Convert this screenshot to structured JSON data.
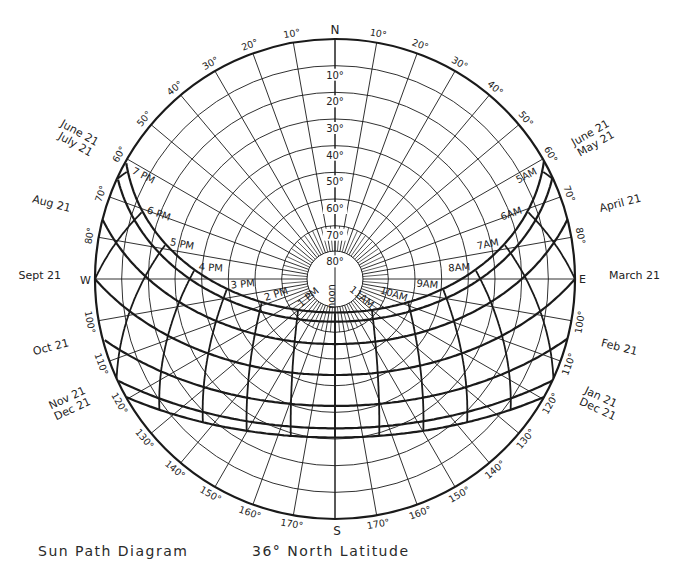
{
  "caption": {
    "title": "Sun Path Diagram",
    "latitude_label": "36° North Latitude"
  },
  "geometry": {
    "center": [
      335,
      279
    ],
    "radius": 240,
    "inner_circle_radius": 28,
    "latitude_deg": 36,
    "line_color": "#1a1a1a",
    "background": "#ffffff"
  },
  "cardinal": {
    "north": "N",
    "south": "S",
    "east": "E",
    "west": "W"
  },
  "altitude_circles": [
    10,
    20,
    30,
    40,
    50,
    60,
    70,
    80
  ],
  "altitude_labels": [
    "10°",
    "20°",
    "30°",
    "40°",
    "50°",
    "60°",
    "70°",
    "80°"
  ],
  "azimuth_spokes_step_deg": 10,
  "azimuth_labels": [
    {
      "azimuth": 10,
      "text": "170°"
    },
    {
      "azimuth": 20,
      "text": "160°"
    },
    {
      "azimuth": 30,
      "text": "150°"
    },
    {
      "azimuth": 40,
      "text": "140°"
    },
    {
      "azimuth": 50,
      "text": "130°"
    },
    {
      "azimuth": 60,
      "text": "120°"
    },
    {
      "azimuth": 70,
      "text": "110°"
    },
    {
      "azimuth": 80,
      "text": "100°"
    },
    {
      "azimuth": 100,
      "text": "80°"
    },
    {
      "azimuth": 110,
      "text": "70°"
    },
    {
      "azimuth": 120,
      "text": "60°"
    },
    {
      "azimuth": 130,
      "text": "50°"
    },
    {
      "azimuth": 140,
      "text": "40°"
    },
    {
      "azimuth": 150,
      "text": "30°"
    },
    {
      "azimuth": 160,
      "text": "20°"
    },
    {
      "azimuth": 170,
      "text": "10°"
    },
    {
      "azimuth": -10,
      "text": "170°"
    },
    {
      "azimuth": -20,
      "text": "160°"
    },
    {
      "azimuth": -30,
      "text": "150°"
    },
    {
      "azimuth": -40,
      "text": "140°"
    },
    {
      "azimuth": -50,
      "text": "130°"
    },
    {
      "azimuth": -60,
      "text": "120°"
    },
    {
      "azimuth": -70,
      "text": "110°"
    },
    {
      "azimuth": -80,
      "text": "100°"
    },
    {
      "azimuth": -100,
      "text": "80°"
    },
    {
      "azimuth": -110,
      "text": "70°"
    },
    {
      "azimuth": -120,
      "text": "60°"
    },
    {
      "azimuth": -130,
      "text": "50°"
    },
    {
      "azimuth": -140,
      "text": "40°"
    },
    {
      "azimuth": -150,
      "text": "30°"
    },
    {
      "azimuth": -160,
      "text": "20°"
    },
    {
      "azimuth": -170,
      "text": "10°"
    }
  ],
  "date_paths": [
    {
      "declination": 23.44,
      "east_label": "June 21\nMay 21",
      "west_label": "June 21\nJuly 21",
      "show_east": true,
      "show_west": true
    },
    {
      "declination": 20.0,
      "east_label": "",
      "west_label": "",
      "show_east": false,
      "show_west": false
    },
    {
      "declination": 11.6,
      "east_label": "April 21",
      "west_label": "Aug 21",
      "show_east": true,
      "show_west": true
    },
    {
      "declination": 0.0,
      "east_label": "March 21",
      "west_label": "Sept 21",
      "show_east": true,
      "show_west": true
    },
    {
      "declination": -11.6,
      "east_label": "Feb 21",
      "west_label": "Oct 21",
      "show_east": true,
      "show_west": true
    },
    {
      "declination": -20.0,
      "east_label": "Jan 21\nDec 21",
      "west_label": "Nov 21\nDec 21",
      "show_east": true,
      "show_west": true
    },
    {
      "declination": -23.44,
      "east_label": "",
      "west_label": "",
      "show_east": false,
      "show_west": false
    }
  ],
  "hour_lines": [
    {
      "hour_angle": -105,
      "label": "5AM"
    },
    {
      "hour_angle": -90,
      "label": "6AM"
    },
    {
      "hour_angle": -75,
      "label": "7AM"
    },
    {
      "hour_angle": -60,
      "label": "8AM"
    },
    {
      "hour_angle": -45,
      "label": "9AM"
    },
    {
      "hour_angle": -30,
      "label": "10AM"
    },
    {
      "hour_angle": -15,
      "label": "11AM"
    },
    {
      "hour_angle": 0,
      "label": "noon"
    },
    {
      "hour_angle": 15,
      "label": "1 PM"
    },
    {
      "hour_angle": 30,
      "label": "2 PM"
    },
    {
      "hour_angle": 45,
      "label": "3 PM"
    },
    {
      "hour_angle": 60,
      "label": "4 PM"
    },
    {
      "hour_angle": 75,
      "label": "5 PM"
    },
    {
      "hour_angle": 90,
      "label": "6 PM"
    },
    {
      "hour_angle": 105,
      "label": "7 PM"
    }
  ]
}
